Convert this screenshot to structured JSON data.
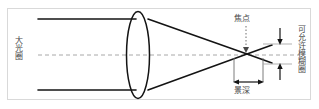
{
  "figure": {
    "frame_color": "#d9d9d9",
    "background": "#ffffff",
    "line_color": "#1a1a1a",
    "axis_color": "#9a9a9a",
    "text_color": "#4a4a4a"
  },
  "labels": {
    "aperture": "大光圈",
    "focus_point": "焦点",
    "depth_of_field": "景深",
    "circle_of_confusion": "可允许模糊圈"
  },
  "icons": {
    "focus_pointer": "dotted-down-arrow-icon",
    "dof_measure": "double-headed-arrow-icon",
    "coc_top": "down-arrow-icon",
    "coc_bottom": "up-arrow-icon",
    "lens": "biconvex-lens-icon",
    "optical_axis": "dashed-axis-icon"
  },
  "geometry": {
    "frame": {
      "x": 7,
      "y": 8,
      "width": 304,
      "height": 92
    },
    "lens": {
      "cx": 138,
      "cy": 55,
      "rx": 11,
      "ry": 43
    },
    "focal_point": {
      "x": 247,
      "y": 54
    },
    "ray_top_y": 19,
    "ray_bottom_y": 90,
    "ray_start_x": 38,
    "axis_y": 55,
    "dof_left_x": 234,
    "dof_right_x": 262,
    "dof_bracket_y": 80,
    "coc_top_y": 44,
    "coc_bottom_y": 64,
    "coc_arrow_x": 280
  }
}
